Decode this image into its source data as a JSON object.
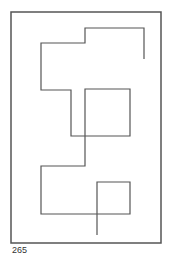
{
  "figure": {
    "caption": "265",
    "stroke_color": "#555555",
    "stroke_width": 1.2,
    "frame": {
      "x": 11,
      "y": 12,
      "width": 150,
      "height": 231
    },
    "path_points": [
      [
        144,
        59
      ],
      [
        144,
        28
      ],
      [
        85,
        28
      ],
      [
        85,
        43
      ],
      [
        41,
        43
      ],
      [
        41,
        90
      ],
      [
        71,
        90
      ],
      [
        71,
        136
      ],
      [
        130,
        136
      ],
      [
        130,
        89
      ],
      [
        85,
        89
      ],
      [
        85,
        166
      ],
      [
        41,
        166
      ],
      [
        41,
        214
      ],
      [
        130,
        214
      ],
      [
        130,
        182
      ],
      [
        97,
        182
      ],
      [
        97,
        235
      ]
    ]
  }
}
